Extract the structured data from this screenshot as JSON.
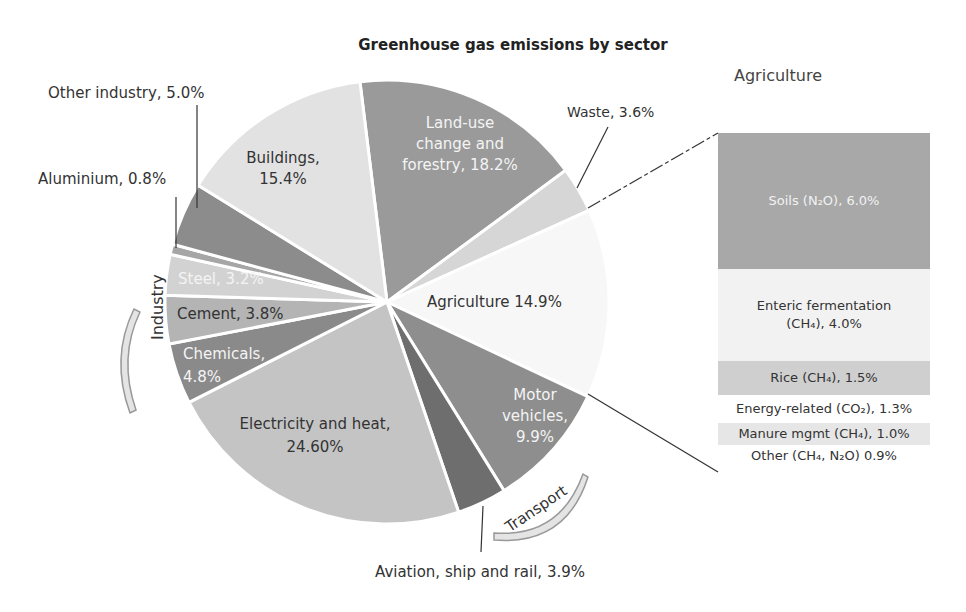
{
  "chart_data": {
    "type": "pie",
    "title": "Greenhouse gas emissions by sector",
    "unit": "%",
    "slices": [
      {
        "label": "Land-use change and forestry",
        "value": 18.2,
        "color": "#9a9a9a"
      },
      {
        "label": "Waste",
        "value": 3.6,
        "color": "#d6d6d6"
      },
      {
        "label": "Agriculture",
        "value": 14.9,
        "color": "#f7f7f7"
      },
      {
        "label": "Motor vehicles",
        "value": 9.9,
        "color": "#8e8e8e"
      },
      {
        "label": "Aviation, ship and rail",
        "value": 3.9,
        "color": "#6e6e6e"
      },
      {
        "label": "Electricity and heat",
        "value": 24.6,
        "color": "#c4c4c4"
      },
      {
        "label": "Chemicals",
        "value": 4.8,
        "color": "#8a8a8a"
      },
      {
        "label": "Cement",
        "value": 3.8,
        "color": "#b4b4b4"
      },
      {
        "label": "Steel",
        "value": 3.2,
        "color": "#d2d2d2"
      },
      {
        "label": "Aluminium",
        "value": 0.8,
        "color": "#a6a6a6"
      },
      {
        "label": "Other industry",
        "value": 5.0,
        "color": "#8c8c8c"
      },
      {
        "label": "Buildings",
        "value": 15.4,
        "color": "#e2e2e2"
      }
    ],
    "groups": [
      {
        "label": "Industry",
        "members": [
          "Chemicals",
          "Cement",
          "Steel",
          "Aluminium",
          "Other industry"
        ]
      },
      {
        "label": "Transport",
        "members": [
          "Motor vehicles",
          "Aviation, ship and rail"
        ]
      }
    ],
    "breakdown": {
      "of": "Agriculture",
      "title": "Agriculture",
      "items": [
        {
          "label": "Soils (N2O)",
          "value": 6.0,
          "color": "#a8a8a8"
        },
        {
          "label": "Enteric fermentation (CH4)",
          "value": 4.0,
          "color": "#f2f2f2"
        },
        {
          "label": "Rice (CH4)",
          "value": 1.5,
          "color": "#cfcfcf"
        },
        {
          "label": "Energy-related (CO2)",
          "value": 1.3,
          "color": "#ffffff"
        },
        {
          "label": "Manure mgmt (CH4)",
          "value": 1.0,
          "color": "#e6e6e6"
        },
        {
          "label": "Other (CH4, N2O)",
          "value": 0.9,
          "color": "#ffffff"
        }
      ]
    },
    "legend": "none (direct labels)"
  },
  "labels": {
    "title": "Greenhouse gas emissions by sector",
    "land_use_1": "Land-use",
    "land_use_2": "change and",
    "land_use_3": "forestry, 18.2%",
    "waste": "Waste, 3.6%",
    "agriculture": "Agriculture 14.9%",
    "motor_1": "Motor",
    "motor_2": "vehicles,",
    "motor_3": "9.9%",
    "aviation": "Aviation, ship and rail, 3.9%",
    "electricity_1": "Electricity and heat,",
    "electricity_2": "24.60%",
    "chemicals_1": "Chemicals,",
    "chemicals_2": "4.8%",
    "cement": "Cement, 3.8%",
    "steel": "Steel, 3.2%",
    "aluminium": "Aluminium, 0.8%",
    "other_industry": "Other industry, 5.0%",
    "buildings_1": "Buildings,",
    "buildings_2": "15.4%",
    "industry_group": "Industry",
    "transport_group": "Transport"
  },
  "agri_panel": {
    "title": "Agriculture",
    "rows": [
      {
        "text": "Soils (N₂O), 6.0%",
        "height": 136,
        "bg": "#a8a8a8",
        "light_text": true
      },
      {
        "text_1": "Enteric fermentation",
        "text_2": "(CH₄), 4.0%",
        "height": 92,
        "bg": "#f2f2f2"
      },
      {
        "text": "Rice (CH₄), 1.5%",
        "height": 34,
        "bg": "#cfcfcf"
      },
      {
        "text": "Energy-related (CO₂), 1.3%",
        "height": 28,
        "bg": "#ffffff"
      },
      {
        "text": "Manure mgmt (CH₄), 1.0%",
        "height": 22,
        "bg": "#e6e6e6"
      },
      {
        "text": "Other (CH₄, N₂O) 0.9%",
        "height": 22,
        "bg": "#ffffff"
      }
    ]
  }
}
